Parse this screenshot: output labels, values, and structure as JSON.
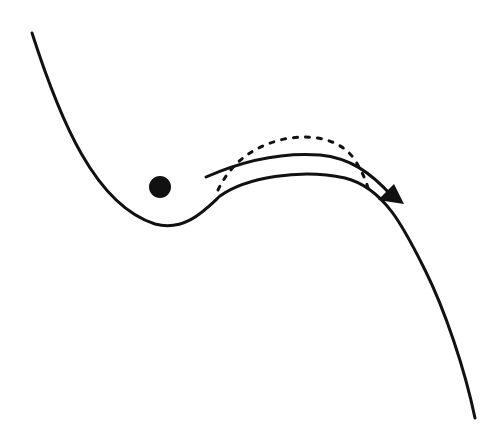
{
  "diagram": {
    "kind": "potential-energy-landscape",
    "width": 500,
    "height": 429,
    "colors": {
      "background": "#ffffff",
      "stroke": "#111111",
      "ball": "#111111"
    },
    "elements": [
      {
        "id": "landscape-curve",
        "type": "solid-curve",
        "description": "energy well with barrier then steep descent"
      },
      {
        "id": "ball",
        "type": "filled-circle",
        "cx": 160,
        "cy": 187,
        "r": 11
      },
      {
        "id": "tunneling-arrow",
        "type": "solid-arrow",
        "description": "path over/through barrier to the right"
      },
      {
        "id": "classical-path",
        "type": "dotted-curve",
        "description": "dotted arc above barrier"
      }
    ]
  }
}
